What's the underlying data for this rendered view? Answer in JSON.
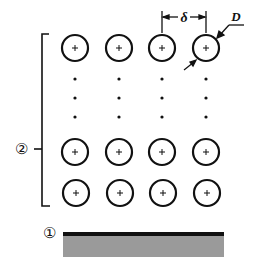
{
  "diagram": {
    "labels": {
      "array_label": "②",
      "substrate_label": "①",
      "spacing_symbol": "δ",
      "diameter_symbol": "D"
    },
    "grid": {
      "columns": 4,
      "visible_rows": 3,
      "ellipsis_rows": 3,
      "element_marker": "+"
    },
    "colors": {
      "line": "#111111",
      "substrate_fill": "#9a9a9a",
      "substrate_top": "#111111",
      "background": "#ffffff"
    }
  }
}
